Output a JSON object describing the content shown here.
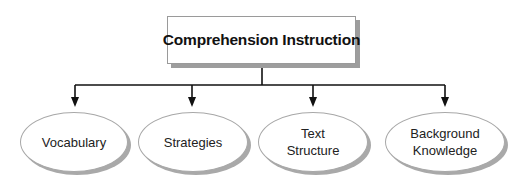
{
  "diagram": {
    "title": "Comprehension Instruction",
    "children": [
      {
        "id": "vocabulary",
        "label_lines": [
          "Vocabulary"
        ]
      },
      {
        "id": "strategies",
        "label_lines": [
          "Strategies"
        ]
      },
      {
        "id": "text-structure",
        "label_lines": [
          "Text",
          "Structure"
        ]
      },
      {
        "id": "background-knowledge",
        "label_lines": [
          "Background",
          "Knowledge"
        ]
      }
    ],
    "colors": {
      "line": "#111111",
      "box_border": "#9a9a9a",
      "shadow": "#9d9d9d",
      "background": "#ffffff"
    }
  }
}
